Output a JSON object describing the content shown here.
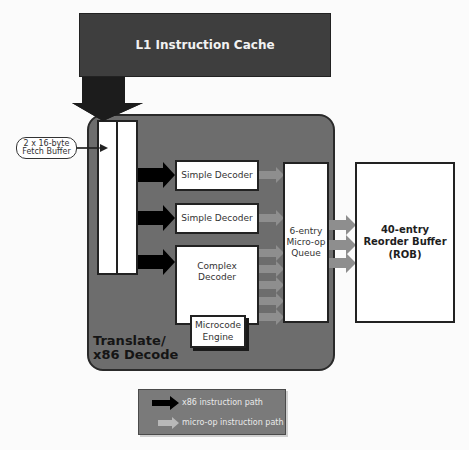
{
  "diagram": {
    "l1_cache": {
      "label": "L1 Instruction Cache"
    },
    "fetch_buffer_callout": {
      "line1": "2 x 16-byte",
      "line2": "Fetch Buffer"
    },
    "decode_block": {
      "line1": "Translate/",
      "line2": "x86 Decode"
    },
    "decoders": [
      {
        "label": "Simple Decoder"
      },
      {
        "label": "Simple Decoder"
      },
      {
        "line1": "Complex",
        "line2": "Decoder"
      }
    ],
    "microcode_engine": {
      "line1": "Microcode",
      "line2": "Engine"
    },
    "micro_op_queue": {
      "line1": "6-entry",
      "line2": "Micro-op",
      "line3": "Queue"
    },
    "reorder_buffer": {
      "line1": "40-entry",
      "line2": "Reorder Buffer",
      "line3": "(ROB)"
    },
    "legend": {
      "items": [
        {
          "label": "x86 instruction path",
          "color": "#000000"
        },
        {
          "label": "micro-op instruction path",
          "color": "#9a9a9a"
        }
      ]
    },
    "colors": {
      "l1_fill": "#3e3e3e",
      "decode_fill": "#6d6d6d",
      "x86_arrow": "#000000",
      "uop_arrow": "#8e8e8e"
    }
  }
}
